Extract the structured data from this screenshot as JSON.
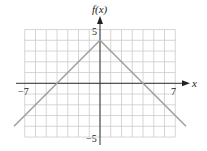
{
  "chart_data": {
    "type": "line",
    "title": "",
    "xlabel": "x",
    "ylabel": "f(x)",
    "xlim": [
      -7,
      7
    ],
    "ylim": [
      -5,
      5
    ],
    "grid": true,
    "x_ticks_labeled": [
      "-7",
      "7"
    ],
    "y_ticks_labeled": [
      "5",
      "-5"
    ],
    "series": [
      {
        "name": "f(x)",
        "x": [
          -8,
          0,
          8
        ],
        "values": [
          -4,
          4,
          -4
        ]
      }
    ],
    "colors": {
      "line": "#a0a0a0",
      "grid": "#cccccc",
      "axis": "#333333"
    }
  },
  "labels": {
    "y_axis": "f(x)",
    "x_axis": "x",
    "x_min": "−7",
    "x_max": "7",
    "y_max": "5",
    "y_min": "−5"
  }
}
